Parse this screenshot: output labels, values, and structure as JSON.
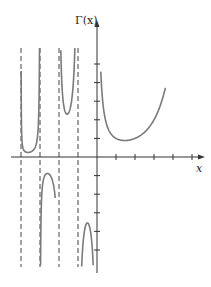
{
  "chart_data": {
    "type": "line",
    "title": "",
    "function": "Gamma function",
    "ylabel": "Γ(x)",
    "xlabel": "x",
    "xlim": [
      -4.1,
      5.7
    ],
    "ylim": [
      -6.2,
      5.2
    ],
    "grid": false,
    "legend": null,
    "x_ticks": [
      -4,
      -3,
      -2,
      -1,
      1,
      2,
      3,
      4,
      5
    ],
    "y_ticks": [
      -5,
      -4,
      -3,
      -2,
      -1,
      1,
      2,
      3,
      4,
      5
    ],
    "tick_labels_shown": false,
    "vertical_asymptotes": [
      -4,
      -3,
      -2,
      -1,
      0
    ],
    "series": [
      {
        "name": "Γ(x), 0<x<3.6",
        "interval": [
          0.2,
          3.6
        ],
        "points": [
          [
            0.2,
            4.59
          ],
          [
            0.5,
            1.77
          ],
          [
            1,
            1
          ],
          [
            1.46,
            0.886
          ],
          [
            2,
            1
          ],
          [
            2.5,
            1.33
          ],
          [
            3,
            2
          ],
          [
            3.5,
            3.32
          ]
        ]
      },
      {
        "name": "Γ(x), -1<x<0",
        "interval": [
          -0.95,
          -0.2
        ],
        "points": [
          [
            -0.95,
            -20.4
          ],
          [
            -0.8,
            -5.74
          ],
          [
            -0.5,
            -3.54
          ],
          [
            -0.2,
            -5.82
          ]
        ]
      },
      {
        "name": "Γ(x), -2<x<-1",
        "interval": [
          -1.97,
          -1.03
        ],
        "points": [
          [
            -1.97,
            17.2
          ],
          [
            -1.8,
            4.2
          ],
          [
            -1.5,
            2.36
          ],
          [
            -1.2,
            4.85
          ],
          [
            -1.03,
            34.2
          ]
        ]
      },
      {
        "name": "Γ(x), -3<x<-2",
        "interval": [
          -2.99,
          -2.2
        ],
        "points": [
          [
            -2.99,
            -33
          ],
          [
            -2.8,
            -1.6
          ],
          [
            -2.5,
            -0.945
          ],
          [
            -2.2,
            -2.4
          ]
        ]
      },
      {
        "name": "Γ(x), -4<x<-3",
        "interval": [
          -3.995,
          -3.005
        ],
        "points": [
          [
            -3.99,
            10
          ],
          [
            -3.8,
            0.42
          ],
          [
            -3.5,
            0.27
          ],
          [
            -3.2,
            0.72
          ],
          [
            -3.01,
            11
          ]
        ]
      }
    ]
  },
  "labels": {
    "y_axis": "Γ(x)",
    "x_axis": "x"
  },
  "colors": {
    "curve": "#7a7a7a",
    "axis": "#333333",
    "asymptote": "#444444"
  }
}
